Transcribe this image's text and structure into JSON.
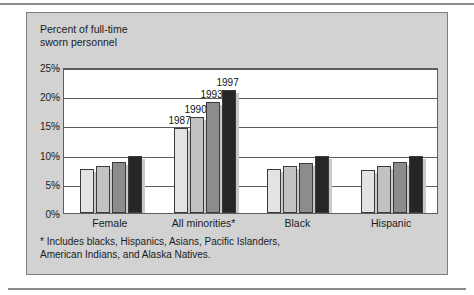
{
  "figure": {
    "title": "Percent of full-time\nsworn personnel",
    "footnote": "* Includes blacks, Hispanics, Asians, Pacific Islanders,\nAmerican Indians, and Alaska Natives."
  },
  "chart_data": {
    "type": "bar",
    "title": "Percent of full-time sworn personnel",
    "xlabel": "",
    "ylabel": "Percent of full-time sworn personnel",
    "ylim": [
      0,
      25
    ],
    "yticks": [
      "0%",
      "5%",
      "10%",
      "15%",
      "20%",
      "25%"
    ],
    "ytick_values": [
      0,
      5,
      10,
      15,
      20,
      25
    ],
    "grid": true,
    "legend": "inline year labels above All minorities bars",
    "categories": [
      "Female",
      "All minorities*",
      "Black",
      "Hispanic"
    ],
    "series": [
      {
        "name": "1987",
        "color": "#e3e3e3",
        "values": [
          7.5,
          14.5,
          7.5,
          7.4
        ]
      },
      {
        "name": "1990",
        "color": "#c2c2c2",
        "values": [
          8.0,
          16.5,
          8.0,
          8.0
        ]
      },
      {
        "name": "1993",
        "color": "#8c8c8c",
        "values": [
          8.7,
          19.0,
          8.6,
          8.7
        ]
      },
      {
        "name": "1997",
        "color": "#262626",
        "values": [
          9.7,
          21.0,
          9.7,
          9.7
        ]
      }
    ],
    "annotations": [
      {
        "text": "1987",
        "series": "1987",
        "category": "All minorities*"
      },
      {
        "text": "1990",
        "series": "1990",
        "category": "All minorities*"
      },
      {
        "text": "1993",
        "series": "1993",
        "category": "All minorities*"
      },
      {
        "text": "1997",
        "series": "1997",
        "category": "All minorities*"
      }
    ]
  }
}
